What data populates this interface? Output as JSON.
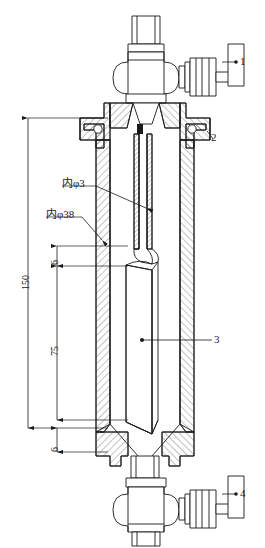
{
  "drawing": {
    "title": "",
    "type": "engineering-sectional-assembly",
    "line_color": "#1a1a1a",
    "hatch_color": "#555555",
    "background": "#ffffff"
  },
  "part_labels": [
    {
      "id": "1",
      "text": "1",
      "x": 243,
      "y": 62,
      "leader_from_x": 213,
      "leader_from_y": 62,
      "target": "top-valve-handwheel"
    },
    {
      "id": "2",
      "text": "2",
      "x": 215,
      "y": 137,
      "leader_from_x": 203,
      "leader_from_y": 129,
      "target": "top-flange"
    },
    {
      "id": "3",
      "text": "3",
      "x": 218,
      "y": 343,
      "leader_from_x": 148,
      "leader_from_y": 343,
      "target": "inner-sleeve"
    },
    {
      "id": "4",
      "text": "4",
      "x": 243,
      "y": 494,
      "leader_from_x": 213,
      "leader_from_y": 494,
      "target": "bottom-valve-handwheel"
    }
  ],
  "dimensions": [
    {
      "name": "overall-length",
      "value": "150",
      "x": 22,
      "y": 280,
      "from_y": 118,
      "to_y": 428,
      "line_x": 28,
      "rotated": true
    },
    {
      "name": "upper-gap",
      "value": "6",
      "x": 51,
      "y": 262,
      "from_y": 246,
      "to_y": 266,
      "line_x": 57,
      "rotated": true
    },
    {
      "name": "sleeve-length",
      "value": "75",
      "x": 51,
      "y": 350,
      "from_y": 266,
      "to_y": 420,
      "line_x": 57,
      "rotated": true
    },
    {
      "name": "lower-gap",
      "value": "6",
      "x": 51,
      "y": 448,
      "from_y": 428,
      "to_y": 452,
      "line_x": 57,
      "rotated": true
    }
  ],
  "annotations": [
    {
      "name": "inner-diameter-3",
      "text": "内φ3",
      "x": 62,
      "y": 183,
      "leader_to_x": 148,
      "leader_to_y": 207
    },
    {
      "name": "inner-diameter-38",
      "text": "内φ38",
      "x": 46,
      "y": 214,
      "leader_to_x": 100,
      "leader_to_y": 240
    }
  ],
  "components": {
    "top_valve": "needle-valve-with-handwheel",
    "top_flange": "bolted-flange-with-o-ring",
    "dip_tube": "center-dip-tube",
    "vessel_body": "cylindrical-pressure-vessel",
    "inner_sleeve": "removable-liner-tube",
    "bottom_cone": "conical-outlet",
    "bottom_valve": "needle-valve-with-handwheel"
  }
}
